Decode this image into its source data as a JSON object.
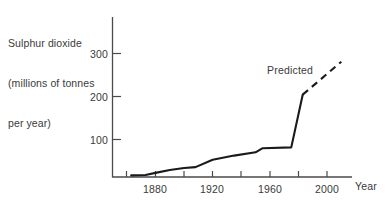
{
  "chart_data": {
    "type": "line",
    "title": "Sulphur dioxide (millions of tonnes per year)",
    "title_lines": [
      "Sulphur dioxide",
      "(millions of tonnes",
      "per year)"
    ],
    "xlabel": "Year",
    "ylabel": "Sulphur dioxide (millions of tonnes per year)",
    "xlim": [
      1860,
      2010
    ],
    "ylim": [
      0,
      330
    ],
    "xticks": [
      1880,
      1920,
      1960,
      2000
    ],
    "xtick_labels": [
      "1880",
      "1920",
      "1960",
      "2000"
    ],
    "xminor_ticks": [
      1860,
      1900,
      1940,
      1980
    ],
    "yticks": [
      100,
      200,
      300
    ],
    "ytick_labels": [
      "100",
      "200",
      "300"
    ],
    "grid": false,
    "legend": false,
    "annotations": [
      {
        "text": "Predicted",
        "x": 1975,
        "y": 265
      }
    ],
    "series": [
      {
        "name": "Observed",
        "style": "solid",
        "color": "#1a1a1a",
        "x": [
          1863,
          1873,
          1880,
          1890,
          1900,
          1908,
          1920,
          1935,
          1950,
          1955,
          1975,
          1983
        ],
        "y": [
          4,
          5,
          10,
          17,
          22,
          24,
          42,
          52,
          60,
          70,
          72,
          200
        ]
      },
      {
        "name": "Predicted",
        "style": "dashed",
        "color": "#1a1a1a",
        "x": [
          1983,
          2010
        ],
        "y": [
          200,
          280
        ]
      }
    ]
  },
  "axis": {
    "y_axis_name": "y-axis",
    "x_axis_name": "x-axis"
  }
}
